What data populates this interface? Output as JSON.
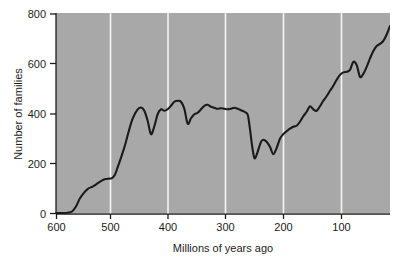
{
  "chart_data": {
    "type": "line",
    "title": "",
    "subtitle": "",
    "xlabel": "Millions of years ago",
    "ylabel": "Number of families",
    "xlim": [
      600,
      0
    ],
    "ylim": [
      0,
      850
    ],
    "x_ticks": [
      600,
      500,
      400,
      300,
      200,
      100
    ],
    "y_ticks": [
      0,
      200,
      400,
      600,
      800
    ],
    "x_tick_labels": [
      "600",
      "500",
      "400",
      "300",
      "200",
      "100"
    ],
    "y_tick_labels": [
      "0",
      "200",
      "400",
      "600",
      "800"
    ],
    "grid": "vertical-white-gridlines",
    "legend": "none",
    "x_axis_reversed": true,
    "plot_background": "#a8a8a8",
    "line_color": "#1a1a1a",
    "gridline_color": "#f2f2f2",
    "series": [
      {
        "name": "Marine and continental family diversity",
        "x": [
          600,
          590,
          580,
          572,
          565,
          558,
          550,
          543,
          535,
          528,
          520,
          512,
          505,
          500,
          495,
          490,
          483,
          476,
          470,
          463,
          455,
          448,
          442,
          436,
          430,
          424,
          418,
          412,
          406,
          400,
          394,
          388,
          382,
          376,
          370,
          364,
          358,
          352,
          346,
          340,
          334,
          328,
          322,
          316,
          310,
          304,
          298,
          292,
          286,
          280,
          274,
          268,
          262,
          256,
          252,
          248,
          244,
          240,
          236,
          232,
          228,
          222,
          216,
          210,
          204,
          198,
          192,
          186,
          180,
          174,
          168,
          162,
          156,
          150,
          144,
          138,
          132,
          126,
          120,
          114,
          108,
          102,
          96,
          90,
          84,
          78,
          72,
          66,
          60,
          54,
          48,
          42,
          36,
          30,
          24,
          18,
          12,
          6,
          0
        ],
        "y": [
          2,
          2,
          3,
          8,
          28,
          60,
          85,
          100,
          108,
          118,
          130,
          138,
          140,
          142,
          155,
          185,
          230,
          280,
          330,
          380,
          415,
          425,
          412,
          372,
          318,
          350,
          398,
          418,
          412,
          418,
          432,
          448,
          452,
          448,
          420,
          360,
          382,
          398,
          404,
          418,
          432,
          436,
          428,
          424,
          420,
          422,
          420,
          418,
          420,
          424,
          420,
          414,
          408,
          396,
          340,
          270,
          222,
          235,
          262,
          288,
          296,
          288,
          268,
          238,
          262,
          300,
          318,
          330,
          340,
          348,
          352,
          368,
          390,
          408,
          430,
          418,
          412,
          430,
          452,
          470,
          492,
          512,
          536,
          556,
          566,
          568,
          576,
          608,
          596,
          548,
          560,
          588,
          622,
          652,
          672,
          680,
          692,
          718,
          752
        ],
        "units": "families",
        "annotations": [
          {
            "x": 440,
            "y": 425,
            "label": "Ordovician peak"
          },
          {
            "x": 436,
            "y": 318,
            "label": "End-Ordovician extinction"
          },
          {
            "x": 368,
            "y": 452,
            "label": "Devonian high"
          },
          {
            "x": 364,
            "y": 360,
            "label": "Late Devonian extinction"
          },
          {
            "x": 244,
            "y": 222,
            "label": "End-Permian extinction"
          },
          {
            "x": 210,
            "y": 238,
            "label": "End-Triassic extinction"
          },
          {
            "x": 66,
            "y": 608,
            "label": "Late Cretaceous peak"
          },
          {
            "x": 54,
            "y": 548,
            "label": "End-Cretaceous extinction"
          },
          {
            "x": 0,
            "y": 752,
            "label": "Present diversity"
          }
        ]
      }
    ]
  },
  "figure": {
    "axis_x_title": "Millions of years ago",
    "axis_y_title": "Number of families",
    "tick_0": "0",
    "tick_200": "200",
    "tick_400": "400",
    "tick_600": "600",
    "tick_800": "800",
    "xtick_600": "600",
    "xtick_500": "500",
    "xtick_400": "400",
    "xtick_300": "300",
    "xtick_200": "200",
    "xtick_100": "100"
  }
}
